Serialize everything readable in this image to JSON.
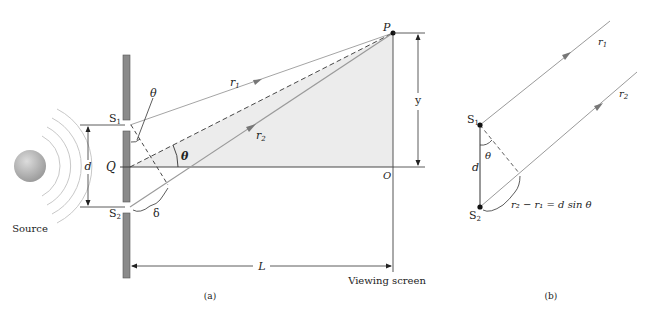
{
  "panel_a": {
    "caption": "(a)",
    "source_label": "Source",
    "s1_label": "S",
    "s1_sub": "1",
    "s2_label": "S",
    "s2_sub": "2",
    "q_label": "Q",
    "d_label": "d",
    "theta_label_top": "θ",
    "theta_label_angle": "θ",
    "delta_label": "δ",
    "r1_label": "r",
    "r1_sub": "1",
    "r2_label": "r",
    "r2_sub": "2",
    "p_label": "P",
    "o_label": "O",
    "y_label": "y",
    "l_label": "L",
    "screen_label": "Viewing screen"
  },
  "panel_b": {
    "caption": "(b)",
    "s1_label": "S",
    "s1_sub": "1",
    "s2_label": "S",
    "s2_sub": "2",
    "d_label": "d",
    "theta_label": "θ",
    "r1_label": "r",
    "r1_sub": "1",
    "r2_label": "r",
    "r2_sub": "2",
    "path_diff_label": "r₂ − r₁ = d sin θ"
  },
  "colors": {
    "barrier": "#8a8a8a",
    "shade": "#ececec",
    "ray": "#9a9a9a",
    "line": "#333333",
    "source": "#b5b5b5"
  }
}
